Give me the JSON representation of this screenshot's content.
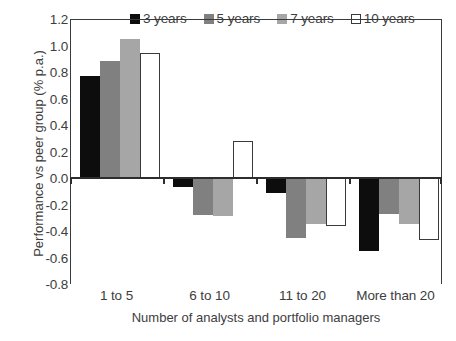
{
  "chart_data": {
    "type": "bar",
    "title": "",
    "subtitle": "",
    "xlabel": "Number of analysts and portfolio managers",
    "ylabel": "Performance vs peer group (% p.a.)",
    "categories": [
      "1 to 5",
      "6 to 10",
      "11 to 20",
      "More than 20"
    ],
    "series": [
      {
        "name": "3 years",
        "color": "#0d0d0d",
        "border": "#0d0d0d",
        "values": [
          0.77,
          -0.07,
          -0.11,
          -0.55
        ]
      },
      {
        "name": "5 years",
        "color": "#808080",
        "border": "#808080",
        "values": [
          0.88,
          -0.28,
          -0.45,
          -0.27
        ]
      },
      {
        "name": "7 years",
        "color": "#a6a6a6",
        "border": "#a6a6a6",
        "values": [
          1.05,
          -0.29,
          -0.35,
          -0.35
        ]
      },
      {
        "name": "10 years",
        "color": "#ffffff",
        "border": "#3a3a3a",
        "values": [
          0.94,
          0.28,
          -0.36,
          -0.47
        ]
      }
    ],
    "ylim": [
      -0.8,
      1.2
    ],
    "yticks": [
      1.2,
      1.0,
      0.8,
      0.6,
      0.4,
      0.2,
      0.0,
      -0.2,
      -0.4,
      -0.6,
      -0.8
    ],
    "ytick_labels": [
      "1.2",
      "1.0",
      "0.8",
      "0.6",
      "0.4",
      "0.2",
      "0.0",
      "-0.2",
      "-0.4",
      "-0.6",
      "-0.8"
    ],
    "grid": false,
    "legend_position": "top",
    "legend_entries": [
      "3 years",
      "5 years",
      "7 years",
      "10 years"
    ],
    "zero_line": true
  }
}
